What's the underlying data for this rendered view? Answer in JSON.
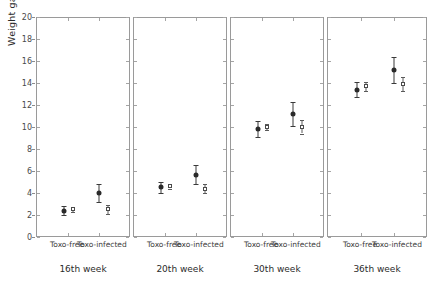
{
  "chart_data": {
    "type": "scatter",
    "title": "",
    "xlabel": "",
    "ylabel": "Weight gain (kg)",
    "ylim": [
      0,
      20
    ],
    "ytick_step": 2,
    "yticks": [
      0,
      2,
      4,
      6,
      8,
      10,
      12,
      14,
      16,
      18,
      20
    ],
    "grid": false,
    "legend_position": "none",
    "series": [
      {
        "name": "filled-circle",
        "marker": "filled circle with error bars"
      },
      {
        "name": "open-square",
        "marker": "open square with error bars"
      }
    ],
    "panels": [
      {
        "label": "16th week",
        "groups": [
          {
            "label": "Toxo-free",
            "points": [
              {
                "series": "filled-circle",
                "value": 2.5,
                "err_low": 2.1,
                "err_high": 2.9
              },
              {
                "series": "open-square",
                "value": 2.6,
                "err_low": 2.4,
                "err_high": 2.8
              }
            ]
          },
          {
            "label": "Toxo-infected",
            "points": [
              {
                "series": "filled-circle",
                "value": 4.1,
                "err_low": 3.3,
                "err_high": 4.9
              },
              {
                "series": "open-square",
                "value": 2.6,
                "err_low": 2.2,
                "err_high": 3.0
              }
            ]
          }
        ]
      },
      {
        "label": "20th week",
        "groups": [
          {
            "label": "Toxo-free",
            "points": [
              {
                "series": "filled-circle",
                "value": 4.6,
                "err_low": 4.1,
                "err_high": 5.1
              },
              {
                "series": "open-square",
                "value": 4.7,
                "err_low": 4.5,
                "err_high": 4.9
              }
            ]
          },
          {
            "label": "Toxo-infected",
            "points": [
              {
                "series": "filled-circle",
                "value": 5.7,
                "err_low": 4.9,
                "err_high": 6.6
              },
              {
                "series": "open-square",
                "value": 4.5,
                "err_low": 4.1,
                "err_high": 4.9
              }
            ]
          }
        ]
      },
      {
        "label": "30th week",
        "groups": [
          {
            "label": "Toxo-free",
            "points": [
              {
                "series": "filled-circle",
                "value": 9.9,
                "err_low": 9.2,
                "err_high": 10.6
              },
              {
                "series": "open-square",
                "value": 10.1,
                "err_low": 9.8,
                "err_high": 10.4
              }
            ]
          },
          {
            "label": "Toxo-infected",
            "points": [
              {
                "series": "filled-circle",
                "value": 11.3,
                "err_low": 10.2,
                "err_high": 12.4
              },
              {
                "series": "open-square",
                "value": 10.1,
                "err_low": 9.5,
                "err_high": 10.7
              }
            ]
          }
        ]
      },
      {
        "label": "36th week",
        "groups": [
          {
            "label": "Toxo-free",
            "points": [
              {
                "series": "filled-circle",
                "value": 13.5,
                "err_low": 12.8,
                "err_high": 14.2
              },
              {
                "series": "open-square",
                "value": 13.8,
                "err_low": 13.4,
                "err_high": 14.2
              }
            ]
          },
          {
            "label": "Toxo-infected",
            "points": [
              {
                "series": "filled-circle",
                "value": 15.3,
                "err_low": 14.1,
                "err_high": 16.5
              },
              {
                "series": "open-square",
                "value": 14.0,
                "err_low": 13.4,
                "err_high": 14.6
              }
            ]
          }
        ]
      }
    ]
  },
  "axis": {
    "y_title": "Weight gain (kg)",
    "y_labels": [
      "20",
      "18",
      "16",
      "14",
      "12",
      "10",
      "8",
      "6",
      "4",
      "2",
      "0"
    ]
  },
  "colors": {
    "filled_marker": "#2a2a2a",
    "open_marker": "#4a4a4a",
    "axis": "#9a9a9a",
    "text": "#2b2b2b",
    "background": "#ffffff"
  }
}
